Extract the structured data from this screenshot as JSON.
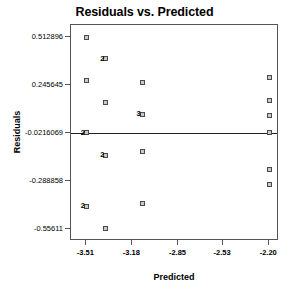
{
  "chart_data": {
    "type": "scatter",
    "title": "Residuals vs. Predicted",
    "xlabel": "Predicted",
    "ylabel": "Residuals",
    "grid": false,
    "legend": null,
    "xlim": [
      -3.62,
      -2.13
    ],
    "ylim": [
      -0.625,
      0.58
    ],
    "xticks": [
      "-3.51",
      "-3.18",
      "-2.85",
      "-2.53",
      "-2.20"
    ],
    "xtick_values": [
      -3.51,
      -3.18,
      -2.85,
      -2.53,
      -2.2
    ],
    "yticks": [
      "0.512896",
      "0.245645",
      "-0.0216069",
      "-0.288858",
      "-0.55611"
    ],
    "ytick_values": [
      0.512896,
      0.245645,
      -0.0216069,
      -0.288858,
      -0.55611
    ],
    "reference_line": {
      "orientation": "horizontal",
      "y": -0.0216069
    },
    "points": [
      {
        "x": -3.51,
        "y": 0.512896,
        "count": 1
      },
      {
        "x": -3.51,
        "y": 0.268,
        "count": 1
      },
      {
        "x": -3.51,
        "y": -0.0216069,
        "count": 2
      },
      {
        "x": -3.51,
        "y": -0.43,
        "count": 2
      },
      {
        "x": -3.37,
        "y": 0.392,
        "count": 2
      },
      {
        "x": -3.37,
        "y": 0.145,
        "count": 1
      },
      {
        "x": -3.37,
        "y": -0.148,
        "count": 2
      },
      {
        "x": -3.37,
        "y": -0.553,
        "count": 1
      },
      {
        "x": -3.11,
        "y": 0.261,
        "count": 1
      },
      {
        "x": -3.11,
        "y": 0.083,
        "count": 3
      },
      {
        "x": -3.11,
        "y": -0.124,
        "count": 1
      },
      {
        "x": -3.11,
        "y": -0.415,
        "count": 1
      },
      {
        "x": -2.2,
        "y": 0.285,
        "count": 1
      },
      {
        "x": -2.2,
        "y": 0.158,
        "count": 1
      },
      {
        "x": -2.2,
        "y": 0.075,
        "count": 1
      },
      {
        "x": -2.2,
        "y": -0.0216069,
        "count": 1
      },
      {
        "x": -2.2,
        "y": -0.224,
        "count": 1
      },
      {
        "x": -2.2,
        "y": -0.309,
        "count": 1
      }
    ]
  }
}
